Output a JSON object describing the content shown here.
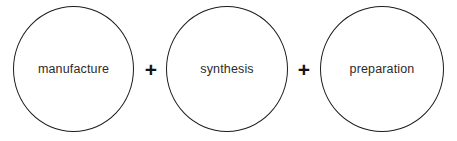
{
  "diagram": {
    "type": "venn-style-circles-sum",
    "background_color": "#ffffff",
    "stroke_color": "#1c1c1c",
    "text_color": "#2b2b2b",
    "nodes": [
      {
        "id": "node-1",
        "label": "manufacture"
      },
      {
        "id": "node-2",
        "label": "synthesis"
      },
      {
        "id": "node-3",
        "label": "preparation"
      }
    ],
    "operators": [
      {
        "id": "operator-1",
        "symbol": "+"
      },
      {
        "id": "operator-2",
        "symbol": "+"
      }
    ]
  }
}
